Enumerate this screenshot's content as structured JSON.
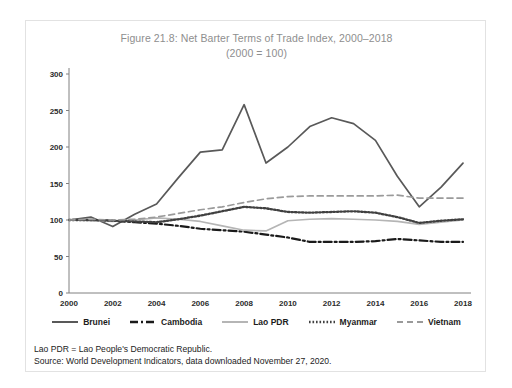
{
  "figure": {
    "title_line1": "Figure 21.8: Net Barter Terms of Trade Index, 2000–2018",
    "title_line2": "(2000 = 100)",
    "notes": {
      "abbreviation": "Lao PDR = Lao People's Democratic Republic.",
      "source": "Source: World Development Indicators, data downloaded November 27, 2020."
    },
    "colors": {
      "brunei": "#595959",
      "cambodia": "#1a1a1a",
      "lao_pdr": "#b5b5b5",
      "myanmar": "#404040",
      "vietnam": "#9a9a9a",
      "axis": "#808080",
      "title_text": "#8e8e8e",
      "frame_border": "#e2e2e2"
    }
  },
  "chart_data": {
    "type": "line",
    "title": "Figure 21.8: Net Barter Terms of Trade Index, 2000–2018 (2000 = 100)",
    "xlabel": "",
    "ylabel": "",
    "grid": false,
    "legend_position": "bottom",
    "xlim": [
      2000,
      2018
    ],
    "ylim": [
      0,
      300
    ],
    "yticks": [
      0,
      50,
      100,
      150,
      200,
      250,
      300
    ],
    "xticks": [
      2000,
      2002,
      2004,
      2006,
      2008,
      2010,
      2012,
      2014,
      2016,
      2018
    ],
    "x": [
      2000,
      2001,
      2002,
      2003,
      2004,
      2005,
      2006,
      2007,
      2008,
      2009,
      2010,
      2011,
      2012,
      2013,
      2014,
      2015,
      2016,
      2017,
      2018
    ],
    "series": [
      {
        "name": "Brunei",
        "style": "solid",
        "color": "#595959",
        "values": [
          100,
          104,
          91,
          108,
          122,
          158,
          193,
          196,
          258,
          178,
          200,
          228,
          240,
          232,
          209,
          160,
          118,
          145,
          178
        ]
      },
      {
        "name": "Cambodia",
        "style": "dash-dot",
        "color": "#1a1a1a",
        "values": [
          100,
          100,
          99,
          97,
          95,
          92,
          88,
          86,
          84,
          80,
          76,
          70,
          70,
          70,
          71,
          74,
          72,
          70,
          70
        ]
      },
      {
        "name": "Lao PDR",
        "style": "solid-light",
        "color": "#b5b5b5",
        "values": [
          100,
          99,
          98,
          100,
          103,
          101,
          98,
          92,
          86,
          85,
          99,
          101,
          102,
          101,
          100,
          98,
          94,
          97,
          100
        ]
      },
      {
        "name": "Myanmar",
        "style": "dotted",
        "color": "#404040",
        "values": [
          100,
          100,
          99,
          98,
          97,
          101,
          106,
          112,
          118,
          116,
          111,
          110,
          111,
          112,
          110,
          104,
          96,
          99,
          101
        ]
      },
      {
        "name": "Vietnam",
        "style": "dashed",
        "color": "#9a9a9a",
        "values": [
          100,
          101,
          100,
          101,
          104,
          109,
          114,
          118,
          124,
          129,
          132,
          133,
          133,
          133,
          133,
          134,
          130,
          130,
          130
        ]
      }
    ]
  },
  "legend": {
    "items": [
      {
        "label": "Brunei",
        "style": "solid",
        "color": "#595959"
      },
      {
        "label": "Cambodia",
        "style": "dash-dot",
        "color": "#1a1a1a"
      },
      {
        "label": "Lao PDR",
        "style": "solid-light",
        "color": "#b5b5b5"
      },
      {
        "label": "Myanmar",
        "style": "dotted",
        "color": "#404040"
      },
      {
        "label": "Vietnam",
        "style": "dashed",
        "color": "#9a9a9a"
      }
    ]
  }
}
